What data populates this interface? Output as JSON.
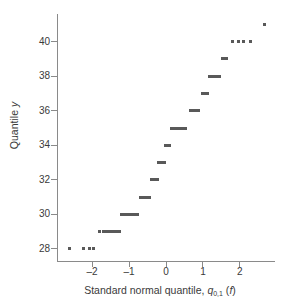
{
  "chart_data": {
    "type": "scatter",
    "title": "",
    "xlabel": "Standard normal quantile, q0,1 (f)",
    "ylabel": "Quantile y",
    "xlim": [
      -2.95,
      2.95
    ],
    "ylim": [
      27.3,
      41.6
    ],
    "grid": false,
    "legend": null,
    "marker_style": "horizontal-dash",
    "marker_color": "#595959",
    "xticks": [
      -2,
      -1,
      0,
      1,
      2
    ],
    "xtick_labels": [
      "–2",
      "–1",
      "0",
      "1",
      "2"
    ],
    "yticks": [
      28,
      30,
      32,
      34,
      36,
      38,
      40
    ],
    "ytick_labels": [
      "28",
      "30",
      "32",
      "34",
      "36",
      "38",
      "40"
    ],
    "series": [
      {
        "name": "sample quantiles",
        "points": [
          {
            "y": 28,
            "x_start": -2.6,
            "x_end": -2.6
          },
          {
            "y": 28,
            "x_start": -2.24,
            "x_end": -2.24
          },
          {
            "y": 28,
            "x_start": -2.06,
            "x_end": -2.06
          },
          {
            "y": 28,
            "x_start": -1.97,
            "x_end": -1.97
          },
          {
            "y": 29,
            "x_start": -1.8,
            "x_end": -1.8
          },
          {
            "y": 29,
            "x_start": -1.7,
            "x_end": -1.26
          },
          {
            "y": 30,
            "x_start": -1.21,
            "x_end": -0.78
          },
          {
            "y": 31,
            "x_start": -0.7,
            "x_end": -0.45
          },
          {
            "y": 32,
            "x_start": -0.4,
            "x_end": -0.24
          },
          {
            "y": 33,
            "x_start": -0.2,
            "x_end": -0.05
          },
          {
            "y": 34,
            "x_start": -0.02,
            "x_end": 0.1
          },
          {
            "y": 35,
            "x_start": 0.15,
            "x_end": 0.53
          },
          {
            "y": 36,
            "x_start": 0.66,
            "x_end": 0.89
          },
          {
            "y": 37,
            "x_start": 0.98,
            "x_end": 1.12
          },
          {
            "y": 38,
            "x_start": 1.18,
            "x_end": 1.44
          },
          {
            "y": 39,
            "x_start": 1.52,
            "x_end": 1.52
          },
          {
            "y": 39,
            "x_start": 1.58,
            "x_end": 1.58
          },
          {
            "y": 39,
            "x_start": 1.64,
            "x_end": 1.64
          },
          {
            "y": 40,
            "x_start": 1.8,
            "x_end": 1.8
          },
          {
            "y": 40,
            "x_start": 1.96,
            "x_end": 1.96
          },
          {
            "y": 40,
            "x_start": 2.1,
            "x_end": 2.1
          },
          {
            "y": 40,
            "x_start": 2.3,
            "x_end": 2.3
          },
          {
            "y": 41,
            "x_start": 2.66,
            "x_end": 2.66
          }
        ]
      }
    ]
  },
  "axes": {
    "y_title_text": "Quantile ",
    "y_title_var": "y",
    "x_title_text": "Standard normal quantile, ",
    "x_title_var": "q",
    "x_title_sub": "0,1",
    "x_title_arg_open": " (",
    "x_title_arg": "f",
    "x_title_arg_close": ")"
  }
}
